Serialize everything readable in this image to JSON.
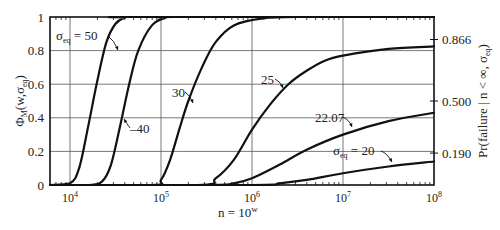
{
  "chart_data": {
    "type": "line",
    "title": "",
    "xlabel": "n = 10^w",
    "xlabel_base": "n = 10",
    "xlabel_sup": "w",
    "ylabel_left": "Φ_M(w, σ_eq)",
    "ylabel_right": "Pr(failure | n < ∞, σ_eq)",
    "xscale": "log",
    "xlim_w": [
      3.78,
      8
    ],
    "ylim": [
      0,
      1
    ],
    "grid": true,
    "x_ticks": [
      {
        "w": 4,
        "label": "10",
        "sup": "4"
      },
      {
        "w": 5,
        "label": "10",
        "sup": "5"
      },
      {
        "w": 6,
        "label": "10",
        "sup": "6"
      },
      {
        "w": 7,
        "label": "10",
        "sup": "7"
      },
      {
        "w": 8,
        "label": "10",
        "sup": "8"
      }
    ],
    "y_ticks_left": [
      {
        "v": 0,
        "label": "0"
      },
      {
        "v": 0.2,
        "label": "0.2"
      },
      {
        "v": 0.4,
        "label": "0.4"
      },
      {
        "v": 0.6,
        "label": "0.6"
      },
      {
        "v": 0.8,
        "label": "0.8"
      },
      {
        "v": 1,
        "label": "1"
      }
    ],
    "y_ticks_right": [
      {
        "v": 0.866,
        "label": "0.866"
      },
      {
        "v": 0.5,
        "label": "0.500"
      },
      {
        "v": 0.19,
        "label": "0.190"
      }
    ],
    "series": [
      {
        "name": "σ_eq = 50",
        "sigma": 50,
        "points": [
          [
            3.78,
            0
          ],
          [
            4.0,
            0.01
          ],
          [
            4.1,
            0.1
          ],
          [
            4.2,
            0.35
          ],
          [
            4.3,
            0.62
          ],
          [
            4.4,
            0.85
          ],
          [
            4.5,
            0.96
          ],
          [
            4.6,
            0.995
          ],
          [
            4.7,
            1
          ],
          [
            8,
            1
          ]
        ]
      },
      {
        "name": "40",
        "sigma": 40,
        "points": [
          [
            3.78,
            0
          ],
          [
            4.2,
            0
          ],
          [
            4.35,
            0.02
          ],
          [
            4.45,
            0.12
          ],
          [
            4.55,
            0.35
          ],
          [
            4.65,
            0.6
          ],
          [
            4.75,
            0.8
          ],
          [
            4.9,
            0.95
          ],
          [
            5.05,
            0.995
          ],
          [
            5.2,
            1
          ],
          [
            8,
            1
          ]
        ]
      },
      {
        "name": "30",
        "sigma": 30,
        "points": [
          [
            3.78,
            0
          ],
          [
            4.9,
            0
          ],
          [
            5.0,
            0.03
          ],
          [
            5.1,
            0.15
          ],
          [
            5.2,
            0.33
          ],
          [
            5.3,
            0.5
          ],
          [
            5.45,
            0.7
          ],
          [
            5.6,
            0.85
          ],
          [
            5.8,
            0.95
          ],
          [
            6.1,
            0.99
          ],
          [
            6.5,
            1
          ],
          [
            8,
            1
          ]
        ]
      },
      {
        "name": "25",
        "sigma": 25,
        "points": [
          [
            3.78,
            0
          ],
          [
            5.4,
            0
          ],
          [
            5.6,
            0.04
          ],
          [
            5.8,
            0.15
          ],
          [
            6.0,
            0.33
          ],
          [
            6.2,
            0.48
          ],
          [
            6.4,
            0.6
          ],
          [
            6.6,
            0.68
          ],
          [
            6.8,
            0.74
          ],
          [
            7.0,
            0.77
          ],
          [
            7.5,
            0.81
          ],
          [
            8,
            0.825
          ]
        ]
      },
      {
        "name": "22.07",
        "sigma": 22.07,
        "points": [
          [
            3.78,
            0
          ],
          [
            5.5,
            0
          ],
          [
            5.8,
            0.01
          ],
          [
            6.0,
            0.04
          ],
          [
            6.3,
            0.12
          ],
          [
            6.6,
            0.21
          ],
          [
            7.0,
            0.3
          ],
          [
            7.5,
            0.38
          ],
          [
            8,
            0.43
          ]
        ]
      },
      {
        "name": "σ_eq = 20",
        "sigma": 20,
        "points": [
          [
            3.78,
            0
          ],
          [
            6.0,
            0
          ],
          [
            6.3,
            0.01
          ],
          [
            6.6,
            0.03
          ],
          [
            7.0,
            0.07
          ],
          [
            7.5,
            0.11
          ],
          [
            8,
            0.14
          ]
        ]
      }
    ],
    "annotations": [
      {
        "text": "σ",
        "sub": "eq",
        "rest": " = 50",
        "x": 56,
        "y": 40,
        "arrow": [
          [
            108,
            36
          ],
          [
            114,
            40
          ],
          [
            118,
            50
          ]
        ]
      },
      {
        "text": "",
        "sub": "",
        "rest": "–40",
        "x": 130,
        "y": 133,
        "arrow": [
          [
            130,
            128
          ],
          [
            127,
            124
          ],
          [
            124,
            119
          ]
        ]
      },
      {
        "text": "",
        "sub": "",
        "rest": "30",
        "x": 172,
        "y": 97,
        "arrow": [
          [
            185,
            92
          ],
          [
            190,
            95
          ],
          [
            193,
            103
          ]
        ]
      },
      {
        "text": "",
        "sub": "",
        "rest": "25",
        "x": 261,
        "y": 84,
        "arrow": [
          [
            275,
            79
          ],
          [
            280,
            81
          ],
          [
            283,
            88
          ]
        ]
      },
      {
        "text": "",
        "sub": "",
        "rest": "22.07",
        "x": 315,
        "y": 122,
        "arrow": [
          [
            342,
            117
          ],
          [
            349,
            119
          ],
          [
            352,
            127
          ]
        ]
      },
      {
        "text": "σ",
        "sub": "eq",
        "rest": " = 20",
        "x": 333,
        "y": 155,
        "arrow": [
          [
            381,
            151
          ],
          [
            387,
            153
          ],
          [
            392,
            162
          ]
        ]
      }
    ]
  }
}
